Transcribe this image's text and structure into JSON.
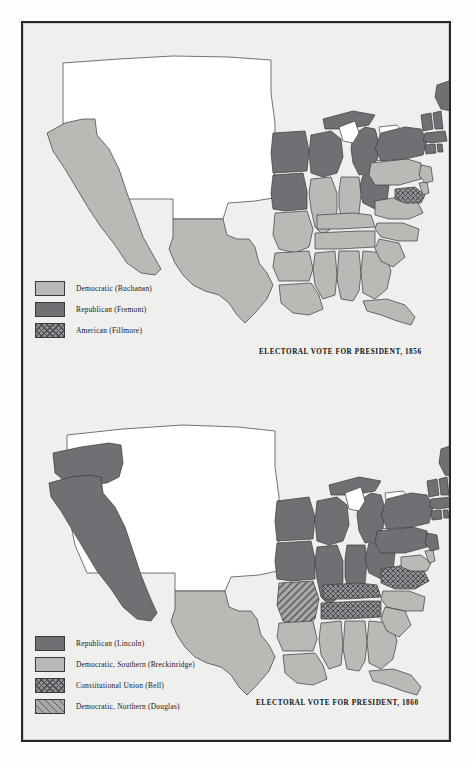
{
  "plate": {
    "figures": [
      {
        "id": "1856",
        "caption": "ELECTORAL VOTE FOR PRESIDENT, 1856",
        "legend": [
          {
            "key": "democratic",
            "label": "Democratic (Buchanan)",
            "pattern": "light",
            "color": "#b9b9b6"
          },
          {
            "key": "republican",
            "label": "Republican (Fremont)",
            "pattern": "solid-dark",
            "color": "#6f7073"
          },
          {
            "key": "american",
            "label": "American (Fillmore)",
            "pattern": "cross",
            "color": "#8f9093"
          }
        ],
        "states": {
          "democratic": [
            "California",
            "Texas",
            "Louisiana",
            "Arkansas",
            "Missouri",
            "Illinois",
            "Indiana",
            "Kentucky",
            "Tennessee",
            "Mississippi",
            "Alabama",
            "Georgia",
            "Florida",
            "South Carolina",
            "North Carolina",
            "Virginia",
            "Delaware",
            "New Jersey",
            "Pennsylvania"
          ],
          "republican": [
            "Iowa",
            "Wisconsin",
            "Michigan",
            "Ohio",
            "New York",
            "Vermont",
            "New Hampshire",
            "Maine",
            "Massachusetts",
            "Rhode Island",
            "Connecticut"
          ],
          "american": [
            "Maryland"
          ],
          "territories": [
            "Unorganized territory (no electoral vote)"
          ]
        }
      },
      {
        "id": "1860",
        "caption": "ELECTORAL VOTE FOR PRESIDENT, 1860",
        "legend": [
          {
            "key": "republican",
            "label": "Republican (Lincoln)",
            "pattern": "solid-dark",
            "color": "#6f7073"
          },
          {
            "key": "democratic_southern",
            "label": "Democratic, Southern (Breckinridge)",
            "pattern": "light",
            "color": "#b9b9b6"
          },
          {
            "key": "constitutional_union",
            "label": "Constitutional Union (Bell)",
            "pattern": "cross",
            "color": "#8f9093"
          },
          {
            "key": "democratic_northern",
            "label": "Democratic, Northern (Douglas)",
            "pattern": "diag",
            "color": "#a9aaa8"
          }
        ],
        "states": {
          "republican": [
            "California",
            "Oregon",
            "Minnesota",
            "Iowa",
            "Wisconsin",
            "Michigan",
            "Illinois",
            "Indiana",
            "Ohio",
            "Pennsylvania",
            "New York",
            "Vermont",
            "New Hampshire",
            "Maine",
            "Massachusetts",
            "Rhode Island",
            "Connecticut",
            "New Jersey"
          ],
          "democratic_southern": [
            "Texas",
            "Louisiana",
            "Arkansas",
            "Mississippi",
            "Alabama",
            "Georgia",
            "Florida",
            "South Carolina",
            "North Carolina",
            "Delaware",
            "Maryland"
          ],
          "constitutional_union": [
            "Virginia",
            "Kentucky",
            "Tennessee"
          ],
          "democratic_northern": [
            "Missouri"
          ],
          "territories": [
            "Unorganized territory (no electoral vote)"
          ]
        }
      }
    ]
  }
}
